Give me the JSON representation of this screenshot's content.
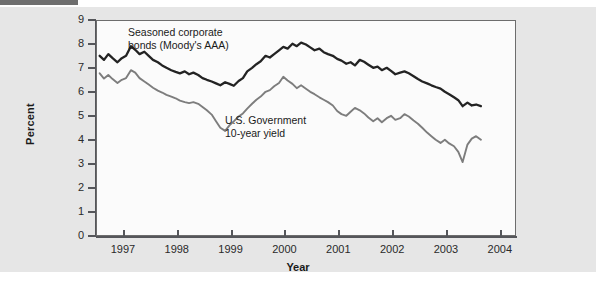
{
  "figure": {
    "y_axis_title": "Percent",
    "x_axis_title": "Year",
    "annotation_corporate": "Seasoned corporate\nbonds (Moody's AAA)",
    "annotation_government": "U.S. Government\n10-year yield",
    "colors": {
      "corporate_line": "#232323",
      "government_line": "#7d7d7d",
      "panel_background": "#e6e6e6",
      "plot_background": "#fbfbfb",
      "axis": "#55565a",
      "top_bar": "#6e6e6e"
    }
  },
  "chart_data": {
    "type": "line",
    "title": "",
    "subtitle": "",
    "xlabel": "Year",
    "ylabel": "Percent",
    "xlim": [
      1996.5,
      2004.3
    ],
    "ylim": [
      0,
      9
    ],
    "grid": false,
    "legend_position": "inline-annotations",
    "x_ticks": [
      "1997",
      "1998",
      "1999",
      "2000",
      "2001",
      "2002",
      "2003",
      "2004"
    ],
    "x_tick_values": [
      1997,
      1998,
      1999,
      2000,
      2001,
      2002,
      2003,
      2004
    ],
    "y_ticks": [
      "0",
      "1",
      "2",
      "3",
      "4",
      "5",
      "6",
      "7",
      "8",
      "9"
    ],
    "y_tick_values": [
      0,
      1,
      2,
      3,
      4,
      5,
      6,
      7,
      8,
      9
    ],
    "annotations": [
      {
        "text": "Seasoned corporate bonds (Moody's AAA)",
        "x": 1997.5,
        "y": 8.4
      },
      {
        "text": "U.S. Government 10-year yield",
        "x": 1999.3,
        "y": 4.7
      }
    ],
    "x": [
      1996.55,
      1996.63,
      1996.71,
      1996.79,
      1996.88,
      1996.96,
      1997.04,
      1997.13,
      1997.21,
      1997.29,
      1997.38,
      1997.46,
      1997.54,
      1997.63,
      1997.71,
      1997.79,
      1997.88,
      1997.96,
      1998.04,
      1998.13,
      1998.21,
      1998.29,
      1998.38,
      1998.46,
      1998.54,
      1998.63,
      1998.71,
      1998.79,
      1998.88,
      1998.96,
      1999.04,
      1999.13,
      1999.21,
      1999.29,
      1999.38,
      1999.46,
      1999.54,
      1999.63,
      1999.71,
      1999.79,
      1999.88,
      1999.96,
      2000.04,
      2000.13,
      2000.21,
      2000.29,
      2000.38,
      2000.46,
      2000.54,
      2000.63,
      2000.71,
      2000.79,
      2000.88,
      2000.96,
      2001.04,
      2001.13,
      2001.21,
      2001.29,
      2001.38,
      2001.46,
      2001.54,
      2001.63,
      2001.71,
      2001.79,
      2001.88,
      2001.96,
      2002.04,
      2002.13,
      2002.21,
      2002.29,
      2002.38,
      2002.46,
      2002.54,
      2002.63,
      2002.71,
      2002.79,
      2002.88,
      2002.96,
      2003.04,
      2003.13,
      2003.21,
      2003.29,
      2003.38,
      2003.46,
      2003.54,
      2003.63
    ],
    "series": [
      {
        "name": "Seasoned corporate bonds (Moody's AAA)",
        "color": "#232323",
        "values": [
          7.55,
          7.38,
          7.62,
          7.45,
          7.28,
          7.45,
          7.55,
          7.95,
          7.8,
          7.62,
          7.72,
          7.55,
          7.38,
          7.28,
          7.15,
          7.05,
          6.95,
          6.88,
          6.82,
          6.9,
          6.78,
          6.85,
          6.75,
          6.62,
          6.55,
          6.48,
          6.4,
          6.32,
          6.45,
          6.38,
          6.3,
          6.5,
          6.62,
          6.9,
          7.05,
          7.2,
          7.32,
          7.55,
          7.48,
          7.62,
          7.78,
          7.92,
          7.85,
          8.05,
          7.95,
          8.1,
          8.02,
          7.9,
          7.78,
          7.85,
          7.7,
          7.62,
          7.55,
          7.42,
          7.35,
          7.22,
          7.28,
          7.15,
          7.38,
          7.3,
          7.18,
          7.05,
          7.1,
          6.95,
          7.05,
          6.92,
          6.78,
          6.85,
          6.9,
          6.82,
          6.7,
          6.58,
          6.48,
          6.4,
          6.32,
          6.25,
          6.18,
          6.05,
          5.95,
          5.82,
          5.7,
          5.45,
          5.6,
          5.48,
          5.52,
          5.45
        ]
      },
      {
        "name": "U.S. Government 10-year yield",
        "color": "#7d7d7d",
        "values": [
          6.82,
          6.6,
          6.75,
          6.58,
          6.42,
          6.55,
          6.62,
          6.95,
          6.85,
          6.62,
          6.48,
          6.35,
          6.22,
          6.1,
          6.02,
          5.92,
          5.85,
          5.78,
          5.68,
          5.62,
          5.58,
          5.62,
          5.55,
          5.42,
          5.28,
          5.1,
          4.82,
          4.55,
          4.42,
          4.65,
          4.82,
          5.02,
          5.15,
          5.35,
          5.55,
          5.72,
          5.85,
          6.05,
          6.12,
          6.28,
          6.42,
          6.68,
          6.52,
          6.38,
          6.2,
          6.32,
          6.18,
          6.05,
          5.95,
          5.82,
          5.72,
          5.62,
          5.48,
          5.25,
          5.12,
          5.05,
          5.22,
          5.38,
          5.28,
          5.15,
          4.98,
          4.82,
          4.95,
          4.78,
          4.95,
          5.05,
          4.88,
          4.95,
          5.12,
          5.02,
          4.85,
          4.72,
          4.55,
          4.35,
          4.2,
          4.05,
          3.92,
          4.05,
          3.9,
          3.78,
          3.55,
          3.12,
          3.85,
          4.1,
          4.2,
          4.05
        ]
      }
    ]
  }
}
